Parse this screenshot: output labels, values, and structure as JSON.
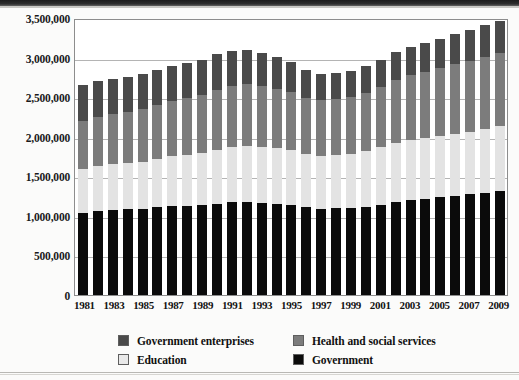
{
  "chart_data": {
    "type": "bar",
    "stacked": true,
    "title": "",
    "subtitle": "",
    "xlabel": "",
    "ylabel": "",
    "ylim": [
      0,
      3500000
    ],
    "ytick_step": 500000,
    "ytick_labels": [
      "0",
      "500,000",
      "1,000,000",
      "1,500,000",
      "2,000,000",
      "2,500,000",
      "3,000,000",
      "3,500,000"
    ],
    "ytick_values": [
      0,
      500000,
      1000000,
      1500000,
      2000000,
      2500000,
      3000000,
      3500000
    ],
    "grid": true,
    "legend_position": "bottom",
    "x": [
      1981,
      1982,
      1983,
      1984,
      1985,
      1986,
      1987,
      1988,
      1989,
      1990,
      1991,
      1992,
      1993,
      1994,
      1995,
      1996,
      1997,
      1998,
      1999,
      2000,
      2001,
      2002,
      2003,
      2004,
      2005,
      2006,
      2007,
      2008,
      2009
    ],
    "xtick_labels": [
      "1981",
      "1983",
      "1985",
      "1987",
      "1989",
      "1991",
      "1993",
      "1995",
      "1997",
      "1999",
      "2001",
      "2003",
      "2005",
      "2007",
      "2009"
    ],
    "series": [
      {
        "name": "Government",
        "color": "#0b0b0b",
        "values": [
          1036000,
          1062000,
          1078000,
          1084000,
          1090000,
          1108000,
          1124000,
          1128000,
          1134000,
          1153000,
          1172000,
          1178000,
          1168000,
          1153000,
          1140000,
          1106000,
          1090000,
          1096000,
          1103000,
          1115000,
          1140000,
          1172000,
          1197000,
          1216000,
          1235000,
          1254000,
          1272000,
          1291000,
          1310000
        ]
      },
      {
        "name": "Education",
        "color": "#e3e3e3",
        "values": [
          556000,
          566000,
          575000,
          584000,
          597000,
          615000,
          629000,
          645000,
          660000,
          681000,
          697000,
          706000,
          706000,
          703000,
          694000,
          678000,
          668000,
          671000,
          683000,
          702000,
          725000,
          747000,
          759000,
          766000,
          776000,
          785000,
          794000,
          806000,
          820000
        ]
      },
      {
        "name": "Health and social services",
        "color": "#7c7c7c",
        "values": [
          606000,
          620000,
          632000,
          645000,
          660000,
          678000,
          698000,
          713000,
          737000,
          760000,
          776000,
          778000,
          766000,
          747000,
          728000,
          709000,
          700000,
          706000,
          719000,
          740000,
          766000,
          800000,
          822000,
          838000,
          855000,
          875000,
          894000,
          915000,
          934000
        ]
      },
      {
        "name": "Government enterprises",
        "color": "#4a4a4a",
        "values": [
          455000,
          452000,
          448000,
          445000,
          449000,
          445000,
          444000,
          440000,
          444000,
          446000,
          444000,
          437000,
          422000,
          404000,
          382000,
          355000,
          338000,
          331000,
          327000,
          332000,
          341000,
          347000,
          354000,
          362000,
          370000,
          378000,
          387000,
          394000,
          400000
        ]
      }
    ],
    "totals": [
      2653000,
      2700000,
      2733000,
      2758000,
      2796000,
      2846000,
      2895000,
      2926000,
      2975000,
      3040000,
      3089000,
      3099000,
      3062000,
      3007000,
      2944000,
      2848000,
      2796000,
      2804000,
      2832000,
      2889000,
      2972000,
      3066000,
      3132000,
      3182000,
      3236000,
      3292000,
      3347000,
      3406000,
      3464000
    ]
  },
  "legend": {
    "items": [
      {
        "label": "Government enterprises",
        "swatch": "gov-ent"
      },
      {
        "label": "Health and social services",
        "swatch": "health"
      },
      {
        "label": "Education",
        "swatch": "edu"
      },
      {
        "label": "Government",
        "swatch": "gov"
      }
    ]
  }
}
